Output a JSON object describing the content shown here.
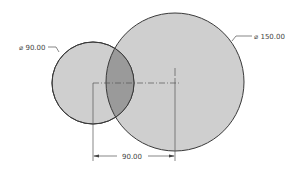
{
  "diagram": {
    "type": "cad-sketch-two-circles",
    "small_circle": {
      "diameter_label": "⌀ 90.00",
      "cx": 93,
      "cy": 83,
      "r": 41
    },
    "large_circle": {
      "diameter_label": "⌀ 150.00",
      "cx": 175,
      "cy": 82,
      "r": 69
    },
    "center_distance_label": "90.00",
    "colors": {
      "fill": "#cfcfcf",
      "overlap": "#9a9a9a",
      "stroke": "#3a3a3a",
      "line": "#555555"
    }
  }
}
